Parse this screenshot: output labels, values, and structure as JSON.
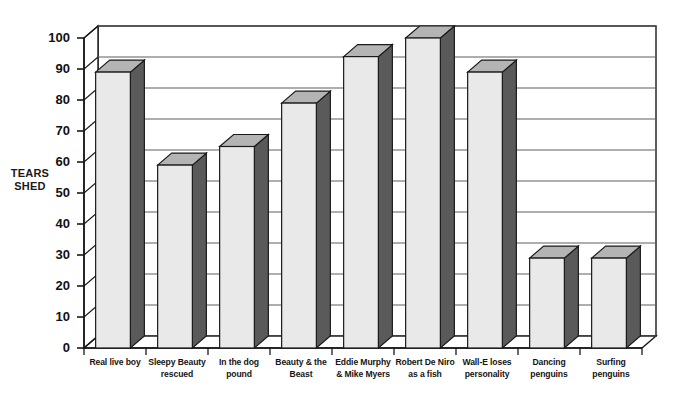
{
  "chart_data": {
    "type": "bar",
    "title": "",
    "subtitle": "",
    "xlabel": "",
    "ylabel": "TEARS\nSHED",
    "ylim": [
      0,
      100
    ],
    "ytick_step": 10,
    "yticks": [
      0,
      10,
      20,
      30,
      40,
      50,
      60,
      70,
      80,
      90,
      100
    ],
    "ytick_labels": [
      "0",
      "10",
      "20",
      "30",
      "40",
      "50",
      "60",
      "70",
      "80",
      "90",
      "100"
    ],
    "grid": true,
    "grid_axis": "y",
    "legend": false,
    "legend_position": "none",
    "style": "3d-column",
    "categories": [
      "Real live boy",
      "Sleepy Beauty\nrescued",
      "In the dog\npound",
      "Beauty & the\nBeast",
      "Eddie Murphy\n& Mike Myers",
      "Robert De Niro\nas a fish",
      "Wall-E loses\npersonality",
      "Dancing\npenguins",
      "Surfing\npenguins"
    ],
    "values": [
      89,
      59,
      65,
      79,
      94,
      100,
      89,
      29,
      29
    ],
    "series": [
      {
        "name": "Tears shed",
        "values": [
          89,
          59,
          65,
          79,
          94,
          100,
          89,
          29,
          29
        ]
      }
    ]
  },
  "colors": {
    "bar_front": "#e9e9e9",
    "bar_side": "#5a5a5a",
    "bar_top": "#b4b4b4",
    "outline": "#1a1a1a",
    "gridline": "#5e5e5e",
    "floor": "#7d7d7d",
    "background": "#ffffff",
    "text": "#141414"
  }
}
